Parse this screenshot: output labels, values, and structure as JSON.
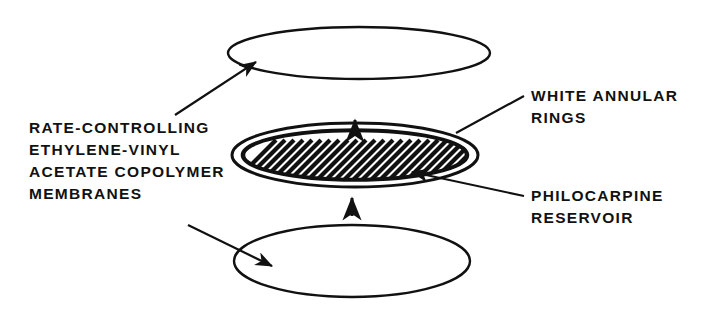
{
  "figure": {
    "type": "exploded-view-technical-diagram",
    "background_color": "#ffffff",
    "ink_color": "#111111"
  },
  "labels": {
    "membranes": {
      "name": "rate-controlling-membranes-label",
      "lines": [
        "RATE-CONTROLLING",
        "ETHYLENE-VINYL",
        "ACETATE COPOLYMER",
        "MEMBRANES"
      ],
      "text": "RATE-CONTROLLING\nETHYLENE-VINYL\nACETATE COPOLYMER\nMEMBRANES",
      "position": "left"
    },
    "rings": {
      "name": "white-annular-rings-label",
      "lines": [
        "WHITE ANNULAR",
        "RINGS"
      ],
      "text": "WHITE ANNULAR\nRINGS",
      "position": "upper-right"
    },
    "reservoir": {
      "name": "philocarpine-reservoir-label",
      "lines": [
        "PHILOCARPINE",
        "RESERVOIR"
      ],
      "text": "PHILOCARPINE\nRESERVOIR",
      "position": "lower-right"
    }
  },
  "components": [
    {
      "name": "top-membrane",
      "shape": "ellipse",
      "cx": 359,
      "cy": 53,
      "rx": 131,
      "ry": 26,
      "filled": false
    },
    {
      "name": "center-annular-ring",
      "shape": "double-ellipse",
      "cx": 355,
      "cy": 155,
      "rx": 123,
      "ry": 32,
      "filled": false
    },
    {
      "name": "philocarpine-reservoir-core",
      "shape": "hatched-ellipse",
      "cx": 355,
      "cy": 155,
      "rx": 111,
      "ry": 24,
      "hatch_angle_degrees": 45,
      "hatch_spacing": 9
    },
    {
      "name": "bottom-membrane",
      "shape": "ellipse",
      "cx": 352,
      "cy": 261,
      "rx": 118,
      "ry": 36,
      "filled": false
    }
  ],
  "assembly_arrows": [
    {
      "name": "upper-assembly-arrow",
      "direction": "up",
      "x": 355,
      "y": 122
    },
    {
      "name": "lower-assembly-arrow",
      "direction": "up",
      "x": 352,
      "y": 200
    }
  ],
  "leader_lines": [
    {
      "name": "leader-to-top-membrane",
      "from": "membranes-label",
      "to": "top-membrane"
    },
    {
      "name": "leader-to-bottom-membrane",
      "from": "membranes-label",
      "to": "bottom-membrane"
    },
    {
      "name": "leader-to-annular-rings",
      "from": "rings-label",
      "to": "center-annular-ring"
    },
    {
      "name": "leader-to-reservoir",
      "from": "reservoir-label",
      "to": "philocarpine-reservoir-core"
    }
  ]
}
